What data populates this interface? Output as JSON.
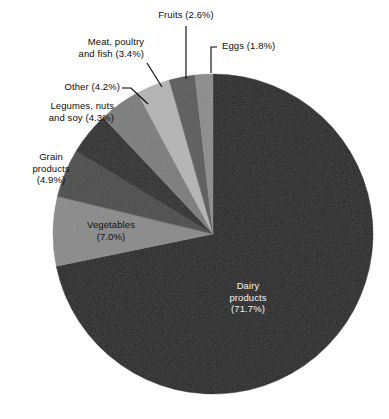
{
  "chart": {
    "type": "pie",
    "title": "",
    "units": "percent",
    "start_angle_deg": 0,
    "direction": "clockwise",
    "center": {
      "x": 213,
      "y": 234
    },
    "radius": 160
  },
  "chart_data": {
    "type": "pie",
    "title": "",
    "xlabel": "",
    "ylabel": "",
    "legend": "none",
    "grid": false,
    "categories": [
      "Dairy products",
      "Vegetables",
      "Grain products",
      "Legumes, nuts and soy",
      "Other",
      "Meat, poultry and fish",
      "Fruits",
      "Eggs"
    ],
    "values": [
      71.7,
      7.0,
      4.9,
      4.3,
      4.2,
      3.4,
      2.6,
      1.8
    ],
    "value_labels": [
      "71.7%",
      "7.0%",
      "4.9%",
      "4.3%",
      "4.2%",
      "3.4%",
      "2.6%",
      "1.8%"
    ],
    "colors": [
      "#232323",
      "#8a8a8a",
      "#4a4a4a",
      "#2a2a2a",
      "#7c7c7c",
      "#b4b4b4",
      "#5a5a5a",
      "#8c8c8c"
    ]
  },
  "slices": [
    {
      "name": "dairy-products",
      "color": "#232323"
    },
    {
      "name": "vegetables",
      "color": "#8a8a8a"
    },
    {
      "name": "grain-products",
      "color": "#4a4a4a"
    },
    {
      "name": "legumes-nuts-soy",
      "color": "#2a2a2a"
    },
    {
      "name": "other",
      "color": "#7c7c7c"
    },
    {
      "name": "meat-poultry-fish",
      "color": "#b4b4b4"
    },
    {
      "name": "fruits",
      "color": "#5a5a5a"
    },
    {
      "name": "eggs",
      "color": "#8c8c8c"
    }
  ],
  "labels": {
    "fruits": "Fruits (2.6%)",
    "eggs": "Eggs (1.8%)",
    "meat_line1": "Meat, poultry",
    "meat_line2": "and fish (3.4%)",
    "other": "Other (4.2%)",
    "legumes_line1": "Legumes, nuts",
    "legumes_line2": "and soy (4.3%)",
    "grain_line1": "Grain",
    "grain_line2": "products",
    "grain_line3": "(4.9%)",
    "vegetables_line1": "Vegetables",
    "vegetables_line2": "(7.0%)",
    "dairy_line1": "Dairy",
    "dairy_line2": "products",
    "dairy_line3": "(71.7%)"
  }
}
